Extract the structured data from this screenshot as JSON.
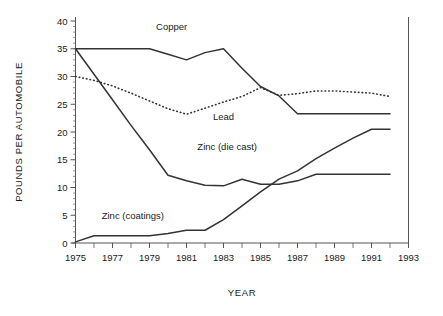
{
  "chart_data": {
    "type": "line",
    "title": "",
    "xlabel": "YEAR",
    "ylabel": "POUNDS PER AUTOMOBILE",
    "xlim": [
      1975,
      1993
    ],
    "ylim": [
      0,
      40
    ],
    "ytick_step": 5,
    "xtick_label_step": 2,
    "xminor_tick_step": 1,
    "grid": false,
    "legend_position": "inline-annotations",
    "xticks": [
      1975,
      1977,
      1979,
      1981,
      1983,
      1985,
      1987,
      1989,
      1991,
      1993
    ],
    "yticks": [
      0,
      5,
      10,
      15,
      20,
      25,
      30,
      35,
      40
    ],
    "series": [
      {
        "name": "Copper",
        "style": "solid",
        "color": "#333333",
        "label_x": 1980.2,
        "label_y": 38.3,
        "x": [
          1975,
          1976,
          1977,
          1978,
          1979,
          1980,
          1981,
          1982,
          1983,
          1984,
          1985,
          1986,
          1987,
          1988,
          1989,
          1990,
          1991,
          1992
        ],
        "values": [
          35.0,
          35.0,
          35.0,
          35.0,
          35.0,
          34.0,
          33.0,
          34.3,
          35.0,
          31.5,
          28.2,
          26.5,
          23.3,
          23.3,
          23.3,
          23.3,
          23.3,
          23.3
        ]
      },
      {
        "name": "Lead",
        "style": "dotted",
        "color": "#333333",
        "label_x": 1983.0,
        "label_y": 22.2,
        "x": [
          1975,
          1976,
          1977,
          1978,
          1979,
          1980,
          1981,
          1982,
          1983,
          1984,
          1985,
          1986,
          1987,
          1988,
          1989,
          1990,
          1991,
          1992
        ],
        "values": [
          30.0,
          29.3,
          28.3,
          27.0,
          25.6,
          24.2,
          23.2,
          24.3,
          25.4,
          26.4,
          28.0,
          26.6,
          26.9,
          27.4,
          27.4,
          27.2,
          27.0,
          26.4
        ]
      },
      {
        "name": "Zinc (die cast)",
        "style": "solid",
        "color": "#333333",
        "label_x": 1983.2,
        "label_y": 16.8,
        "x": [
          1975,
          1976,
          1977,
          1978,
          1979,
          1980,
          1981,
          1982,
          1983,
          1984,
          1985,
          1986,
          1987,
          1988,
          1989,
          1990,
          1991,
          1992
        ],
        "values": [
          35.0,
          30.4,
          25.8,
          21.2,
          16.8,
          12.2,
          11.2,
          10.4,
          10.3,
          11.5,
          10.6,
          10.6,
          11.2,
          12.4,
          12.4,
          12.4,
          12.4,
          12.4
        ]
      },
      {
        "name": "Zinc (coatings)",
        "style": "solid",
        "color": "#333333",
        "label_x": 1978.1,
        "label_y": 4.3,
        "x": [
          1975,
          1976,
          1977,
          1978,
          1979,
          1980,
          1981,
          1982,
          1983,
          1984,
          1985,
          1986,
          1987,
          1988,
          1989,
          1990,
          1991,
          1992
        ],
        "values": [
          0.2,
          1.3,
          1.3,
          1.3,
          1.3,
          1.7,
          2.3,
          2.3,
          4.2,
          6.7,
          9.2,
          11.5,
          13.0,
          15.2,
          17.1,
          18.9,
          20.5,
          20.5
        ]
      }
    ]
  },
  "axes": {
    "y_title": "POUNDS PER AUTOMOBILE",
    "x_title": "YEAR"
  }
}
